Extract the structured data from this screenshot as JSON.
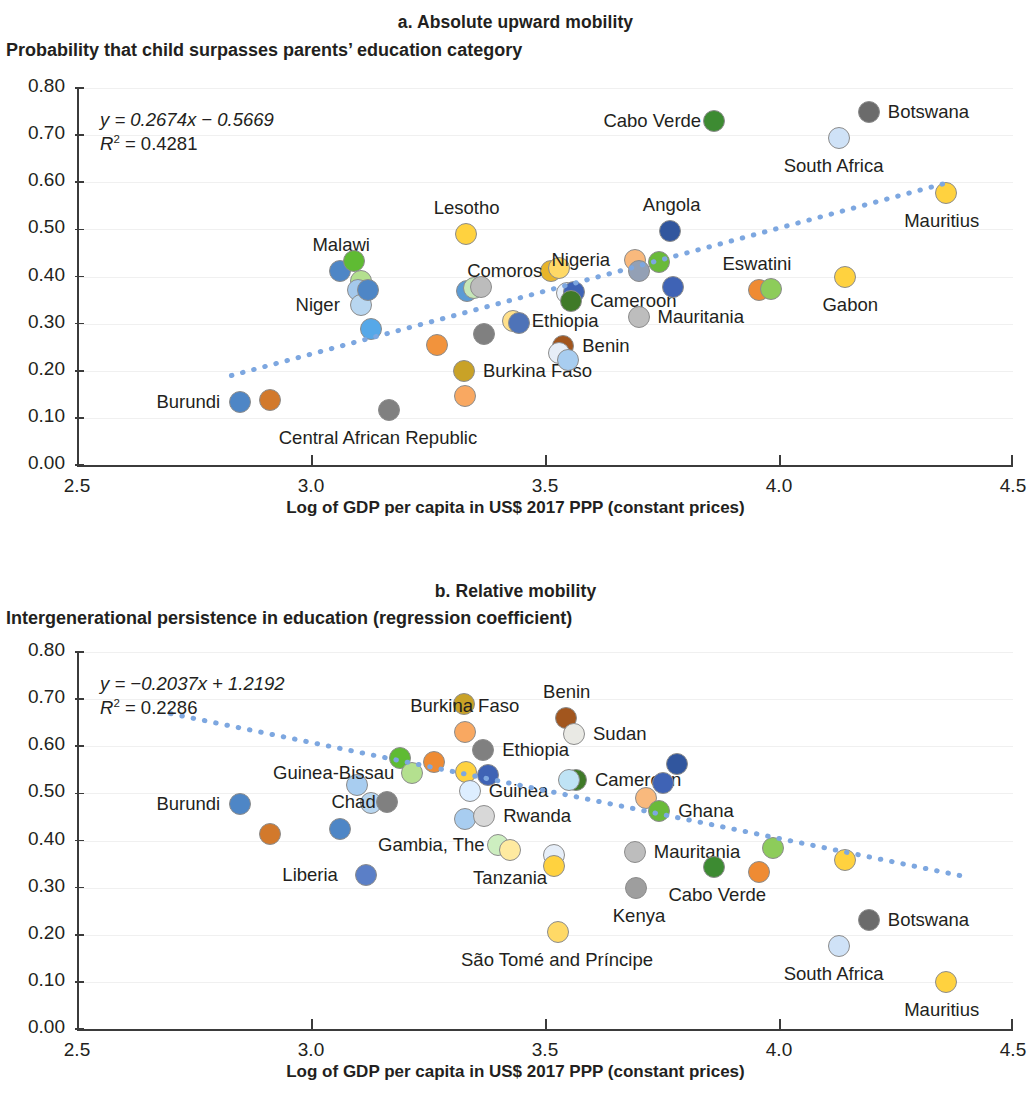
{
  "figure": {
    "x_axis_title": "Log of GDP per capita in US$ 2017 PPP (constant prices)",
    "x_ticks": [
      "2.5",
      "3.0",
      "3.5",
      "4.0",
      "4.5"
    ],
    "y_ticks": [
      "0.80",
      "0.70",
      "0.60",
      "0.50",
      "0.40",
      "0.30",
      "0.20",
      "0.10",
      "0.00"
    ],
    "trend_color": "#7da7e0",
    "marker_border": "#8c8c8c"
  },
  "panel_a": {
    "title": "a. Absolute upward mobility",
    "y_axis_title": "Probability that child surpasses parents’ education category",
    "equation": "y = 0.2674x − 0.5669",
    "r2_prefix": "R",
    "r2_sup": "2",
    "r2_value": " = 0.4281"
  },
  "panel_b": {
    "title": "b. Relative mobility",
    "y_axis_title": "Intergenerational persistence in education (regression coefficient)",
    "equation": "y = −0.2037x + 1.2192",
    "r2_prefix": "R",
    "r2_sup": "2",
    "r2_value": " = 0.2286"
  },
  "chart_data": [
    {
      "type": "scatter",
      "panel": "a",
      "title": "a. Absolute upward mobility",
      "xlabel": "Log of GDP per capita in US$ 2017 PPP (constant prices)",
      "ylabel": "Probability that child surpasses parents’ education category",
      "xlim": [
        2.5,
        4.5
      ],
      "ylim": [
        0.0,
        0.8
      ],
      "xticks": [
        2.5,
        3.0,
        3.5,
        4.0,
        4.5
      ],
      "yticks": [
        0.0,
        0.1,
        0.2,
        0.3,
        0.4,
        0.5,
        0.6,
        0.7,
        0.8
      ],
      "grid": "horizontal",
      "legend": "none",
      "trendline": {
        "slope": 0.2674,
        "intercept": -0.5669,
        "r2": 0.4281,
        "style": "dotted",
        "color": "#7da7e0"
      },
      "points": [
        {
          "label": "Burundi",
          "x": 2.848,
          "y": 0.134,
          "color": "#4e86c6",
          "labeled": true,
          "label_pos": "left"
        },
        {
          "label": "",
          "x": 2.912,
          "y": 0.137,
          "color": "#d2792c",
          "labeled": false
        },
        {
          "label": "Malawi",
          "x": 3.062,
          "y": 0.411,
          "color": "#4e86c6",
          "labeled": true,
          "label_pos": "above"
        },
        {
          "label": "",
          "x": 3.092,
          "y": 0.433,
          "color": "#5fbb33",
          "labeled": false
        },
        {
          "label": "",
          "x": 3.106,
          "y": 0.391,
          "color": "#b4e08f",
          "labeled": false
        },
        {
          "label": "",
          "x": 3.101,
          "y": 0.371,
          "color": "#a5c9ec",
          "labeled": false
        },
        {
          "label": "Niger",
          "x": 3.106,
          "y": 0.339,
          "color": "#b8d6f0",
          "labeled": true,
          "label_pos": "left"
        },
        {
          "label": "",
          "x": 3.122,
          "y": 0.372,
          "color": "#4e86c6",
          "labeled": false
        },
        {
          "label": "",
          "x": 3.128,
          "y": 0.289,
          "color": "#56a8e8",
          "labeled": false
        },
        {
          "label": "Central African Republic",
          "x": 3.167,
          "y": 0.117,
          "color": "#808080",
          "labeled": true,
          "label_pos": "below"
        },
        {
          "label": "",
          "x": 3.27,
          "y": 0.254,
          "color": "#f2933c",
          "labeled": false
        },
        {
          "label": "Burkina Faso",
          "x": 3.327,
          "y": 0.199,
          "color": "#c9a227",
          "labeled": true,
          "label_pos": "right"
        },
        {
          "label": "",
          "x": 3.328,
          "y": 0.146,
          "color": "#f9a861",
          "labeled": false
        },
        {
          "label": "Lesotho",
          "x": 3.331,
          "y": 0.49,
          "color": "#ffd23f",
          "labeled": true,
          "label_pos": "above"
        },
        {
          "label": "",
          "x": 3.334,
          "y": 0.369,
          "color": "#5b9bd5",
          "labeled": false
        },
        {
          "label": "",
          "x": 3.349,
          "y": 0.376,
          "color": "#c6e7b8",
          "labeled": false
        },
        {
          "label": "",
          "x": 3.364,
          "y": 0.377,
          "color": "#bcbcbc",
          "labeled": false
        },
        {
          "label": "",
          "x": 3.37,
          "y": 0.278,
          "color": "#808080",
          "labeled": false
        },
        {
          "label": "Comoros",
          "x": 3.512,
          "y": 0.411,
          "color": "#e8b52b",
          "labeled": true,
          "label_pos": "left"
        },
        {
          "label": "",
          "x": 3.53,
          "y": 0.417,
          "color": "#ffd966",
          "labeled": false
        },
        {
          "label": "Ethiopia",
          "x": 3.431,
          "y": 0.306,
          "color": "#ffe08a",
          "labeled": true,
          "label_pos": "right"
        },
        {
          "label": "",
          "x": 3.445,
          "y": 0.301,
          "color": "#4e73b8",
          "labeled": false
        },
        {
          "label": "Benin",
          "x": 3.539,
          "y": 0.253,
          "color": "#a2561e",
          "labeled": true,
          "label_pos": "right"
        },
        {
          "label": "",
          "x": 3.53,
          "y": 0.238,
          "color": "#e6eef8",
          "labeled": false
        },
        {
          "label": "",
          "x": 3.549,
          "y": 0.222,
          "color": "#a8cdf0",
          "labeled": false
        },
        {
          "label": "",
          "x": 3.548,
          "y": 0.365,
          "color": "#e9f1fb",
          "labeled": false
        },
        {
          "label": "",
          "x": 3.562,
          "y": 0.367,
          "color": "#3f63b5",
          "labeled": false
        },
        {
          "label": "Cameroon",
          "x": 3.556,
          "y": 0.349,
          "color": "#3f7a28",
          "labeled": true,
          "label_pos": "right"
        },
        {
          "label": "Nigeria",
          "x": 3.692,
          "y": 0.434,
          "color": "#f9b97d",
          "labeled": true,
          "label_pos": "left"
        },
        {
          "label": "",
          "x": 3.7,
          "y": 0.412,
          "color": "#93a0b5",
          "labeled": false
        },
        {
          "label": "",
          "x": 3.744,
          "y": 0.43,
          "color": "#6aba3a",
          "labeled": false
        },
        {
          "label": "Mauritania",
          "x": 3.7,
          "y": 0.314,
          "color": "#bdbdbd",
          "labeled": true,
          "label_pos": "right"
        },
        {
          "label": "Angola",
          "x": 3.768,
          "y": 0.497,
          "color": "#31569e",
          "labeled": true,
          "label_pos": "above"
        },
        {
          "label": "",
          "x": 3.774,
          "y": 0.377,
          "color": "#3f63b5",
          "labeled": false
        },
        {
          "label": "Cabo Verde",
          "x": 3.862,
          "y": 0.729,
          "color": "#3d8b32",
          "labeled": true,
          "label_pos": "left"
        },
        {
          "label": "Eswatini",
          "x": 3.958,
          "y": 0.372,
          "color": "#ef8b33",
          "labeled": true,
          "label_pos": "above"
        },
        {
          "label": "",
          "x": 3.982,
          "y": 0.374,
          "color": "#8dcc5a",
          "labeled": false
        },
        {
          "label": "South Africa",
          "x": 4.128,
          "y": 0.693,
          "color": "#cfe2f7",
          "labeled": true,
          "label_pos": "below"
        },
        {
          "label": "Gabon",
          "x": 4.142,
          "y": 0.398,
          "color": "#ffd23f",
          "labeled": true,
          "label_pos": "below"
        },
        {
          "label": "Botswana",
          "x": 4.192,
          "y": 0.75,
          "color": "#6b6b6b",
          "labeled": true,
          "label_pos": "right"
        },
        {
          "label": "Mauritius",
          "x": 4.356,
          "y": 0.578,
          "color": "#ffd23f",
          "labeled": true,
          "label_pos": "below"
        }
      ]
    },
    {
      "type": "scatter",
      "panel": "b",
      "title": "b. Relative mobility",
      "xlabel": "Log of GDP per capita in US$ 2017 PPP (constant prices)",
      "ylabel": "Intergenerational persistence in education (regression coefficient)",
      "xlim": [
        2.5,
        4.5
      ],
      "ylim": [
        0.0,
        0.8
      ],
      "xticks": [
        2.5,
        3.0,
        3.5,
        4.0,
        4.5
      ],
      "yticks": [
        0.0,
        0.1,
        0.2,
        0.3,
        0.4,
        0.5,
        0.6,
        0.7,
        0.8
      ],
      "grid": "horizontal",
      "legend": "none",
      "trendline": {
        "slope": -0.2037,
        "intercept": 1.2192,
        "r2": 0.2286,
        "style": "dotted",
        "color": "#7da7e0"
      },
      "points": [
        {
          "label": "Burundi",
          "x": 2.848,
          "y": 0.477,
          "color": "#4e86c6",
          "labeled": true,
          "label_pos": "left"
        },
        {
          "label": "",
          "x": 2.912,
          "y": 0.414,
          "color": "#d2792c",
          "labeled": false
        },
        {
          "label": "",
          "x": 3.062,
          "y": 0.424,
          "color": "#4e86c6",
          "labeled": false
        },
        {
          "label": "",
          "x": 3.098,
          "y": 0.518,
          "color": "#a8cdf0",
          "labeled": false
        },
        {
          "label": "Liberia",
          "x": 3.117,
          "y": 0.326,
          "color": "#5b7fc7",
          "labeled": true,
          "label_pos": "left"
        },
        {
          "label": "",
          "x": 3.128,
          "y": 0.479,
          "color": "#b8d6f0",
          "labeled": false
        },
        {
          "label": "Chad",
          "x": 3.163,
          "y": 0.481,
          "color": "#808080",
          "labeled": true,
          "label_pos": "left"
        },
        {
          "label": "",
          "x": 3.19,
          "y": 0.576,
          "color": "#5fbb33",
          "labeled": false
        },
        {
          "label": "Guinea-Bissau",
          "x": 3.215,
          "y": 0.543,
          "color": "#b4e08f",
          "labeled": true,
          "label_pos": "left"
        },
        {
          "label": "",
          "x": 3.262,
          "y": 0.567,
          "color": "#ef8b33",
          "labeled": false
        },
        {
          "label": "",
          "x": 3.327,
          "y": 0.69,
          "color": "#c9a227",
          "labeled": false
        },
        {
          "label": "Burkina Faso",
          "x": 3.33,
          "y": 0.63,
          "color": "#f9a861",
          "labeled": true,
          "label_pos": "above"
        },
        {
          "label": "",
          "x": 3.331,
          "y": 0.545,
          "color": "#ffd23f",
          "labeled": false
        },
        {
          "label": "Ethiopia",
          "x": 3.368,
          "y": 0.592,
          "color": "#808080",
          "labeled": true,
          "label_pos": "right"
        },
        {
          "label": "Guinea",
          "x": 3.339,
          "y": 0.505,
          "color": "#ddeeff",
          "labeled": true,
          "label_pos": "right"
        },
        {
          "label": "",
          "x": 3.378,
          "y": 0.54,
          "color": "#3f63b5",
          "labeled": false
        },
        {
          "label": "",
          "x": 3.33,
          "y": 0.446,
          "color": "#a8cdf0",
          "labeled": false
        },
        {
          "label": "Rwanda",
          "x": 3.37,
          "y": 0.452,
          "color": "#d8d8d8",
          "labeled": true,
          "label_pos": "right"
        },
        {
          "label": "Gambia, The",
          "x": 3.4,
          "y": 0.39,
          "color": "#cdeec0",
          "labeled": true,
          "label_pos": "left"
        },
        {
          "label": "Tanzania",
          "x": 3.425,
          "y": 0.38,
          "color": "#ffeaa0",
          "labeled": true,
          "label_pos": "below"
        },
        {
          "label": "",
          "x": 3.52,
          "y": 0.37,
          "color": "#e6eef8",
          "labeled": false
        },
        {
          "label": "",
          "x": 3.52,
          "y": 0.345,
          "color": "#ffd23f",
          "labeled": false
        },
        {
          "label": "São Tomé and Príncipe",
          "x": 3.527,
          "y": 0.206,
          "color": "#ffd966",
          "labeled": true,
          "label_pos": "below"
        },
        {
          "label": "Benin",
          "x": 3.545,
          "y": 0.66,
          "color": "#a2561e",
          "labeled": true,
          "label_pos": "above"
        },
        {
          "label": "Sudan",
          "x": 3.562,
          "y": 0.625,
          "color": "#e9e9e4",
          "labeled": true,
          "label_pos": "right"
        },
        {
          "label": "Cameroon",
          "x": 3.566,
          "y": 0.528,
          "color": "#3f7a28",
          "labeled": true,
          "label_pos": "right"
        },
        {
          "label": "",
          "x": 3.552,
          "y": 0.528,
          "color": "#bfe3f5",
          "labeled": false
        },
        {
          "label": "Mauritania",
          "x": 3.692,
          "y": 0.375,
          "color": "#bdbdbd",
          "labeled": true,
          "label_pos": "right"
        },
        {
          "label": "Kenya",
          "x": 3.694,
          "y": 0.3,
          "color": "#9e9e9e",
          "labeled": true,
          "label_pos": "below"
        },
        {
          "label": "",
          "x": 3.715,
          "y": 0.49,
          "color": "#f9b97d",
          "labeled": false
        },
        {
          "label": "Ghana",
          "x": 3.744,
          "y": 0.462,
          "color": "#6aba3a",
          "labeled": true,
          "label_pos": "right"
        },
        {
          "label": "",
          "x": 3.752,
          "y": 0.522,
          "color": "#3f63b5",
          "labeled": false
        },
        {
          "label": "",
          "x": 3.782,
          "y": 0.563,
          "color": "#31569e",
          "labeled": false
        },
        {
          "label": "Cabo Verde",
          "x": 3.862,
          "y": 0.344,
          "color": "#3d8b32",
          "labeled": true,
          "label_pos": "below"
        },
        {
          "label": "",
          "x": 3.958,
          "y": 0.334,
          "color": "#ef8b33",
          "labeled": false
        },
        {
          "label": "",
          "x": 3.988,
          "y": 0.385,
          "color": "#8dcc5a",
          "labeled": false
        },
        {
          "label": "",
          "x": 4.142,
          "y": 0.358,
          "color": "#ffd23f",
          "labeled": false
        },
        {
          "label": "Botswana",
          "x": 4.192,
          "y": 0.232,
          "color": "#6b6b6b",
          "labeled": true,
          "label_pos": "right"
        },
        {
          "label": "South Africa",
          "x": 4.128,
          "y": 0.176,
          "color": "#cfe2f7",
          "labeled": true,
          "label_pos": "below"
        },
        {
          "label": "Mauritius",
          "x": 4.356,
          "y": 0.1,
          "color": "#ffd23f",
          "labeled": true,
          "label_pos": "below"
        }
      ]
    }
  ]
}
